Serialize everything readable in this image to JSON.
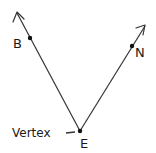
{
  "diagram": {
    "vertex": {
      "label": "E",
      "annotation": "Vertex",
      "x": 80,
      "y": 131
    },
    "rays": [
      {
        "id": "EB",
        "point_label": "B",
        "point": {
          "x": 30,
          "y": 38
        },
        "end": {
          "x": 17,
          "y": 12
        }
      },
      {
        "id": "EN",
        "point_label": "N",
        "point": {
          "x": 132,
          "y": 46
        },
        "end": {
          "x": 145,
          "y": 26
        }
      }
    ],
    "colors": {
      "stroke": "#333333",
      "text": "#1a1a1a",
      "background": "#ffffff"
    }
  },
  "labels": {
    "b": "B",
    "n": "N",
    "e": "E",
    "vertex": "Vertex"
  }
}
